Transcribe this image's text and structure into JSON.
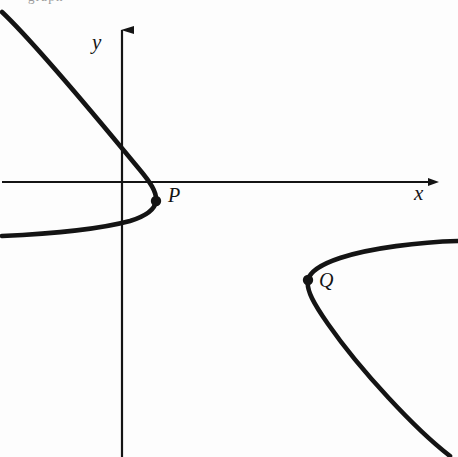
{
  "figure": {
    "background_color": "#fdfdfd",
    "ink_color": "#141414",
    "width": 458,
    "height": 457
  },
  "caption": {
    "cropped_top_text": "graph"
  },
  "axes": {
    "x_axis": {
      "label": "x",
      "label_name": "x-axis-label",
      "y_pixel": 182,
      "x_start": 2,
      "x_end": 438,
      "arrow": "right"
    },
    "y_axis": {
      "label": "y",
      "label_name": "y-axis-label",
      "x_pixel": 122,
      "y_start": 18,
      "y_end": 457,
      "arrow": "up"
    },
    "axis_stroke_width": 2.2
  },
  "points": [
    {
      "label": "P",
      "x": 156,
      "y": 201,
      "marker": "filled-dot",
      "radius": 5.2,
      "label_offset_x": 12,
      "label_offset_y": -16
    },
    {
      "label": "Q",
      "x": 308,
      "y": 280,
      "marker": "filled-dot",
      "radius": 5.2,
      "label_offset_x": 11,
      "label_offset_y": -10
    }
  ],
  "chart_data": {
    "type": "line",
    "title": "",
    "xlabel": "x",
    "ylabel": "y",
    "grid": false,
    "legend": null,
    "annotations": [
      "P",
      "Q"
    ],
    "series": [
      {
        "name": "left-branch",
        "vertex": [
          156,
          201
        ],
        "path": "M 2,12 C 40,48 105,128 140,170 C 150,182 157,192 156,201 C 155,210 146,216 130,221 C 100,229 48,234 2,236",
        "stroke_width": 4.6
      },
      {
        "name": "right-branch",
        "vertex": [
          308,
          280
        ],
        "path": "M 458,241 C 420,242 370,248 340,258 C 322,264 310,271 308,280 C 306,290 314,304 328,324 C 360,370 416,430 450,456",
        "stroke_width": 4.6
      }
    ]
  }
}
